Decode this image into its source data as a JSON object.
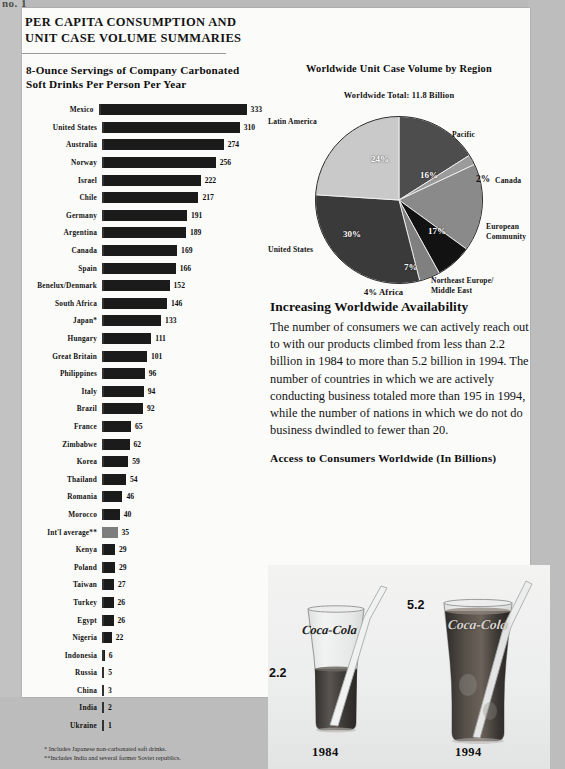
{
  "scan": {
    "edge_text": "no. 1"
  },
  "document": {
    "title_line1": "PER CAPITA CONSUMPTION AND",
    "title_line2": "UNIT CASE VOLUME SUMMARIES"
  },
  "bar_chart_section": {
    "heading_line1": "8-Ounce Servings of Company Carbonated",
    "heading_line2": "Soft Drinks Per Person Per Year",
    "footnote1": "* Includes Japanese non-carbonated soft drinks.",
    "footnote2": "**Includes India and several former Soviet republics."
  },
  "chart_data": [
    {
      "type": "bar",
      "title": "8-Ounce Servings of Company Carbonated Soft Drinks Per Person Per Year",
      "xlabel": "",
      "ylabel": "",
      "orientation": "horizontal",
      "xlim": [
        0,
        333
      ],
      "grid": false,
      "legend": "none",
      "categories": [
        "Mexico",
        "United States",
        "Australia",
        "Norway",
        "Israel",
        "Chile",
        "Germany",
        "Argentina",
        "Canada",
        "Spain",
        "Benelux/Denmark",
        "South Africa",
        "Japan*",
        "Hungary",
        "Great Britain",
        "Philippines",
        "Italy",
        "Brazil",
        "France",
        "Zimbabwe",
        "Korea",
        "Thailand",
        "Romania",
        "Morocco",
        "Int'l average**",
        "Kenya",
        "Poland",
        "Taiwan",
        "Turkey",
        "Egypt",
        "Nigeria",
        "Indonesia",
        "Russia",
        "China",
        "India",
        "Ukraine"
      ],
      "values": [
        333,
        310,
        274,
        256,
        222,
        217,
        191,
        189,
        169,
        166,
        152,
        146,
        133,
        111,
        101,
        96,
        94,
        92,
        65,
        62,
        59,
        54,
        46,
        40,
        35,
        29,
        29,
        27,
        26,
        26,
        22,
        6,
        5,
        3,
        2,
        1
      ],
      "highlight_category": "Int'l average**",
      "highlight_color": "#7d7d7d",
      "bar_color": "#1b1b1b"
    },
    {
      "type": "pie",
      "title": "Worldwide Unit Case Volume by Region",
      "subtitle": "Worldwide Total: 11.8 Billion",
      "legend": "callouts",
      "labels": [
        "Pacific",
        "Canada",
        "European Community",
        "Northeast Europe/Middle East",
        "Africa",
        "United States",
        "Latin America"
      ],
      "values": [
        16,
        2,
        17,
        7,
        4,
        30,
        24
      ],
      "value_suffix": "%",
      "colors": [
        "#4d4d4d",
        "#9b9b9b",
        "#8a8a8a",
        "#121212",
        "#808080",
        "#3a3a3a",
        "#c9c9c9"
      ]
    },
    {
      "type": "bar",
      "title": "Access to Consumers Worldwide (In Billions)",
      "categories": [
        "1984",
        "1994"
      ],
      "values": [
        2.2,
        5.2
      ],
      "ylabel": "Billions",
      "render": "pictorial-glasses"
    }
  ],
  "pie_section": {
    "heading": "Worldwide Unit Case Volume by Region",
    "total_label": "Worldwide Total: 11.8 Billion",
    "callouts": {
      "latin_america": "Latin America",
      "pacific": "Pacific",
      "canada_value": "2%",
      "canada": "Canada",
      "european_community_line1": "European",
      "european_community_line2": "Community",
      "northeast_line1": "Northeast Europe/",
      "northeast_line2": "Middle East",
      "africa": "4% Africa",
      "united_states": "United States"
    },
    "percent_labels": {
      "latin_america": "24%",
      "pacific": "16%",
      "european_community": "17%",
      "northeast": "7%",
      "united_states": "30%"
    }
  },
  "prose": {
    "heading": "Increasing Worldwide Availability",
    "body": "The number of consumers we can actively reach out to with our products climbed from less than 2.2 billion in 1984 to more than 5.2 billion in 1994. The number of countries in which we are actively conducting business totaled more than 195 in 1994, while the number of nations in which we do not do business dwindled to fewer than 20."
  },
  "access_section": {
    "heading": "Access to Consumers Worldwide (In Billions)",
    "glass_1984_value": "2.2",
    "glass_1984_year": "1984",
    "glass_1994_value": "5.2",
    "glass_1994_year": "1994",
    "brand_mark": "Coca-Cola"
  }
}
